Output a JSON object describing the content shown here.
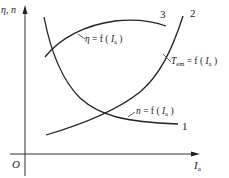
{
  "diagram": {
    "y_axis_label": "η, n",
    "x_axis_label_main": "I",
    "x_axis_label_sub": "a",
    "origin_label": "O",
    "curves": [
      {
        "id": "1",
        "number": "1",
        "label_prefix": "n",
        "label_eq": " = f ( ",
        "label_var": "I",
        "label_sub": "a",
        "label_suffix": " )",
        "description": "speed characteristic, decreasing"
      },
      {
        "id": "2",
        "number": "2",
        "label_prefix": "T",
        "label_prefix_sub": "em",
        "label_eq": " = f ( ",
        "label_var": "I",
        "label_sub": "a",
        "label_suffix": " )",
        "description": "torque characteristic, increasing"
      },
      {
        "id": "3",
        "number": "3",
        "label_prefix": "η",
        "label_eq": " = f ( ",
        "label_var": "I",
        "label_sub": "a",
        "label_suffix": " )",
        "description": "efficiency characteristic, rising then flattening"
      }
    ]
  }
}
